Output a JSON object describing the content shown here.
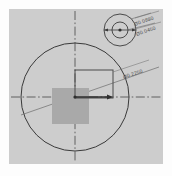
{
  "drawing": {
    "title": "Concentric circle dimension detail",
    "background_color": "#cdcdcd",
    "page_color": "#fdfdfd",
    "line_color": "#3a3a3a",
    "fill_color": "#a9a9a9",
    "canvas": {
      "width": 172,
      "height": 176
    },
    "plot_area": {
      "x": 9,
      "y": 9,
      "width": 154,
      "height": 155
    }
  },
  "main_view": {
    "center": {
      "x": 66,
      "y": 88
    },
    "outer_circle": {
      "radius": 54,
      "stroke": "#3a3a3a"
    },
    "filled_square": {
      "x": 43,
      "y": 79,
      "width": 37,
      "height": 36,
      "fill": "#a9a9a9"
    },
    "outline_rect": {
      "x": 66,
      "y": 61,
      "width": 38,
      "height": 28,
      "stroke": "#4a4a4a"
    },
    "vertical_centerline": {
      "x": 66,
      "y1": 2,
      "y2": 152,
      "style": "dash-dot"
    },
    "horizontal_centerline": {
      "y": 88,
      "x1": 2,
      "x2": 152,
      "style": "dash-dot"
    },
    "diagonal_line": {
      "angle_deg": -19,
      "style": "solid-thin"
    },
    "arrow_leader": {
      "from_x": 66,
      "to_x": 104,
      "y": 88
    },
    "label": "Ø0.2250"
  },
  "inset_view": {
    "center": {
      "x": 111,
      "y": 21
    },
    "outer_circle_radius": 16,
    "inner_circle_radius": 8,
    "center_dot_radius": 1.6,
    "dimension_line": {
      "x1": 95,
      "x2": 127,
      "y": 21
    },
    "labels": {
      "outer": "Ø0.0880",
      "inner": "Ø0.0450"
    }
  },
  "icons": {
    "arrow": "arrow-right-icon",
    "center_mark": "center-mark-icon"
  }
}
